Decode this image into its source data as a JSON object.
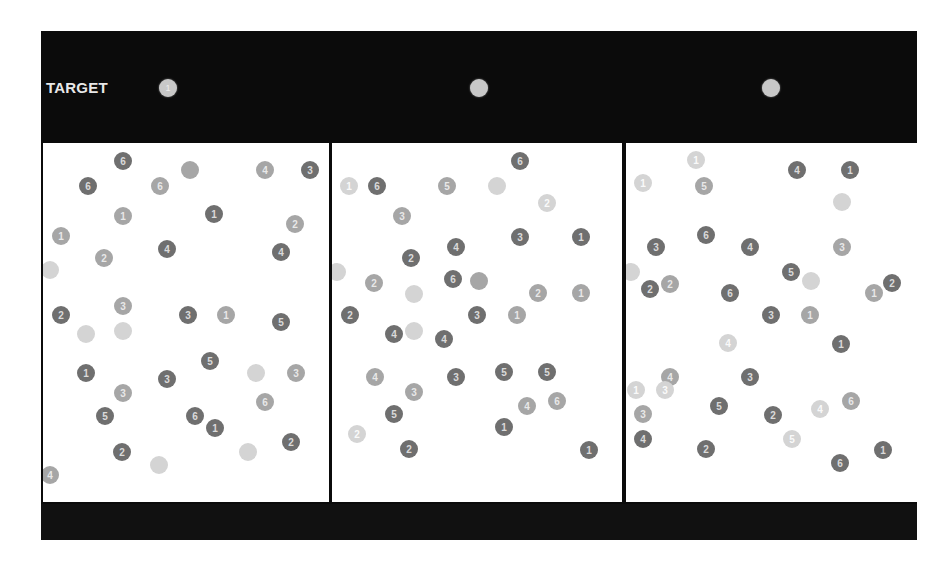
{
  "header": {
    "target_label": "TARGET",
    "targets": [
      {
        "digit": "1",
        "x": 118,
        "y": 48
      },
      {
        "digit": "",
        "x": 429,
        "y": 48
      },
      {
        "digit": "",
        "x": 721,
        "y": 48
      }
    ]
  },
  "panels": [
    {
      "left": 2,
      "width": 286,
      "dots": [
        {
          "d": "6",
          "x": 80,
          "y": 18,
          "t": "dark"
        },
        {
          "d": "6",
          "x": 45,
          "y": 43,
          "t": "dark"
        },
        {
          "d": "6",
          "x": 117,
          "y": 43,
          "t": "mid"
        },
        {
          "d": "",
          "x": 147,
          "y": 27,
          "t": "mid"
        },
        {
          "d": "4",
          "x": 222,
          "y": 27,
          "t": "mid"
        },
        {
          "d": "3",
          "x": 267,
          "y": 27,
          "t": "dark"
        },
        {
          "d": "1",
          "x": 80,
          "y": 73,
          "t": "mid"
        },
        {
          "d": "1",
          "x": 171,
          "y": 71,
          "t": "dark"
        },
        {
          "d": "2",
          "x": 252,
          "y": 81,
          "t": "mid"
        },
        {
          "d": "1",
          "x": 18,
          "y": 93,
          "t": "mid"
        },
        {
          "d": "4",
          "x": 124,
          "y": 106,
          "t": "dark"
        },
        {
          "d": "2",
          "x": 61,
          "y": 115,
          "t": "mid"
        },
        {
          "d": "4",
          "x": 238,
          "y": 109,
          "t": "dark"
        },
        {
          "d": "",
          "x": 7,
          "y": 127,
          "t": "light"
        },
        {
          "d": "3",
          "x": 80,
          "y": 163,
          "t": "mid"
        },
        {
          "d": "2",
          "x": 18,
          "y": 172,
          "t": "dark"
        },
        {
          "d": "3",
          "x": 145,
          "y": 172,
          "t": "dark"
        },
        {
          "d": "1",
          "x": 183,
          "y": 172,
          "t": "mid"
        },
        {
          "d": "5",
          "x": 238,
          "y": 179,
          "t": "dark"
        },
        {
          "d": "",
          "x": 43,
          "y": 191,
          "t": "light"
        },
        {
          "d": "",
          "x": 80,
          "y": 188,
          "t": "light"
        },
        {
          "d": "1",
          "x": 43,
          "y": 230,
          "t": "dark"
        },
        {
          "d": "3",
          "x": 124,
          "y": 236,
          "t": "dark"
        },
        {
          "d": "5",
          "x": 167,
          "y": 218,
          "t": "dark"
        },
        {
          "d": "",
          "x": 213,
          "y": 230,
          "t": "light"
        },
        {
          "d": "3",
          "x": 253,
          "y": 230,
          "t": "mid"
        },
        {
          "d": "3",
          "x": 80,
          "y": 250,
          "t": "mid"
        },
        {
          "d": "5",
          "x": 62,
          "y": 273,
          "t": "dark"
        },
        {
          "d": "6",
          "x": 152,
          "y": 273,
          "t": "dark"
        },
        {
          "d": "1",
          "x": 172,
          "y": 285,
          "t": "dark"
        },
        {
          "d": "6",
          "x": 222,
          "y": 259,
          "t": "mid"
        },
        {
          "d": "2",
          "x": 79,
          "y": 309,
          "t": "dark"
        },
        {
          "d": "",
          "x": 116,
          "y": 322,
          "t": "light"
        },
        {
          "d": "",
          "x": 205,
          "y": 309,
          "t": "light"
        },
        {
          "d": "2",
          "x": 248,
          "y": 299,
          "t": "dark"
        },
        {
          "d": "4",
          "x": 7,
          "y": 332,
          "t": "mid"
        }
      ]
    },
    {
      "left": 291,
      "width": 290,
      "dots": [
        {
          "d": "6",
          "x": 188,
          "y": 18,
          "t": "dark"
        },
        {
          "d": "1",
          "x": 17,
          "y": 43,
          "t": "light"
        },
        {
          "d": "6",
          "x": 45,
          "y": 43,
          "t": "dark"
        },
        {
          "d": "5",
          "x": 115,
          "y": 43,
          "t": "mid"
        },
        {
          "d": "",
          "x": 165,
          "y": 43,
          "t": "light"
        },
        {
          "d": "2",
          "x": 215,
          "y": 60,
          "t": "light"
        },
        {
          "d": "3",
          "x": 70,
          "y": 73,
          "t": "mid"
        },
        {
          "d": "3",
          "x": 188,
          "y": 94,
          "t": "dark"
        },
        {
          "d": "1",
          "x": 249,
          "y": 94,
          "t": "dark"
        },
        {
          "d": "4",
          "x": 124,
          "y": 104,
          "t": "dark"
        },
        {
          "d": "2",
          "x": 79,
          "y": 115,
          "t": "dark"
        },
        {
          "d": "6",
          "x": 121,
          "y": 136,
          "t": "dark"
        },
        {
          "d": "",
          "x": 147,
          "y": 138,
          "t": "mid"
        },
        {
          "d": "",
          "x": 5,
          "y": 129,
          "t": "light"
        },
        {
          "d": "2",
          "x": 42,
          "y": 140,
          "t": "mid"
        },
        {
          "d": "",
          "x": 82,
          "y": 151,
          "t": "light"
        },
        {
          "d": "2",
          "x": 206,
          "y": 150,
          "t": "mid"
        },
        {
          "d": "1",
          "x": 249,
          "y": 150,
          "t": "mid"
        },
        {
          "d": "2",
          "x": 18,
          "y": 172,
          "t": "dark"
        },
        {
          "d": "3",
          "x": 145,
          "y": 172,
          "t": "dark"
        },
        {
          "d": "1",
          "x": 185,
          "y": 172,
          "t": "mid"
        },
        {
          "d": "4",
          "x": 62,
          "y": 191,
          "t": "dark"
        },
        {
          "d": "",
          "x": 82,
          "y": 188,
          "t": "light"
        },
        {
          "d": "4",
          "x": 112,
          "y": 196,
          "t": "dark"
        },
        {
          "d": "4",
          "x": 43,
          "y": 234,
          "t": "mid"
        },
        {
          "d": "3",
          "x": 124,
          "y": 234,
          "t": "dark"
        },
        {
          "d": "5",
          "x": 172,
          "y": 229,
          "t": "dark"
        },
        {
          "d": "5",
          "x": 215,
          "y": 229,
          "t": "dark"
        },
        {
          "d": "3",
          "x": 82,
          "y": 249,
          "t": "mid"
        },
        {
          "d": "5",
          "x": 62,
          "y": 271,
          "t": "dark"
        },
        {
          "d": "4",
          "x": 195,
          "y": 263,
          "t": "mid"
        },
        {
          "d": "6",
          "x": 225,
          "y": 258,
          "t": "mid"
        },
        {
          "d": "2",
          "x": 25,
          "y": 291,
          "t": "light"
        },
        {
          "d": "2",
          "x": 77,
          "y": 306,
          "t": "dark"
        },
        {
          "d": "1",
          "x": 172,
          "y": 284,
          "t": "dark"
        },
        {
          "d": "1",
          "x": 257,
          "y": 307,
          "t": "dark"
        }
      ]
    },
    {
      "left": 585,
      "width": 291,
      "dots": [
        {
          "d": "1",
          "x": 70,
          "y": 17,
          "t": "light"
        },
        {
          "d": "1",
          "x": 17,
          "y": 40,
          "t": "light"
        },
        {
          "d": "5",
          "x": 78,
          "y": 43,
          "t": "mid"
        },
        {
          "d": "4",
          "x": 171,
          "y": 27,
          "t": "dark"
        },
        {
          "d": "1",
          "x": 224,
          "y": 27,
          "t": "dark"
        },
        {
          "d": "",
          "x": 216,
          "y": 59,
          "t": "light"
        },
        {
          "d": "3",
          "x": 30,
          "y": 104,
          "t": "dark"
        },
        {
          "d": "6",
          "x": 80,
          "y": 92,
          "t": "dark"
        },
        {
          "d": "4",
          "x": 124,
          "y": 104,
          "t": "dark"
        },
        {
          "d": "3",
          "x": 216,
          "y": 104,
          "t": "mid"
        },
        {
          "d": "",
          "x": 5,
          "y": 129,
          "t": "light"
        },
        {
          "d": "2",
          "x": 24,
          "y": 146,
          "t": "dark"
        },
        {
          "d": "2",
          "x": 44,
          "y": 141,
          "t": "mid"
        },
        {
          "d": "6",
          "x": 104,
          "y": 150,
          "t": "dark"
        },
        {
          "d": "5",
          "x": 165,
          "y": 129,
          "t": "dark"
        },
        {
          "d": "",
          "x": 185,
          "y": 138,
          "t": "light"
        },
        {
          "d": "1",
          "x": 248,
          "y": 150,
          "t": "mid"
        },
        {
          "d": "2",
          "x": 266,
          "y": 140,
          "t": "dark"
        },
        {
          "d": "3",
          "x": 145,
          "y": 172,
          "t": "dark"
        },
        {
          "d": "1",
          "x": 184,
          "y": 172,
          "t": "mid"
        },
        {
          "d": "1",
          "x": 215,
          "y": 201,
          "t": "dark"
        },
        {
          "d": "4",
          "x": 102,
          "y": 200,
          "t": "light"
        },
        {
          "d": "4",
          "x": 44,
          "y": 234,
          "t": "mid"
        },
        {
          "d": "1",
          "x": 10,
          "y": 247,
          "t": "light"
        },
        {
          "d": "3",
          "x": 39,
          "y": 247,
          "t": "light"
        },
        {
          "d": "3",
          "x": 124,
          "y": 234,
          "t": "dark"
        },
        {
          "d": "3",
          "x": 17,
          "y": 271,
          "t": "mid"
        },
        {
          "d": "5",
          "x": 93,
          "y": 263,
          "t": "dark"
        },
        {
          "d": "2",
          "x": 147,
          "y": 272,
          "t": "dark"
        },
        {
          "d": "4",
          "x": 194,
          "y": 266,
          "t": "light"
        },
        {
          "d": "6",
          "x": 225,
          "y": 258,
          "t": "mid"
        },
        {
          "d": "4",
          "x": 17,
          "y": 296,
          "t": "dark"
        },
        {
          "d": "2",
          "x": 80,
          "y": 306,
          "t": "dark"
        },
        {
          "d": "5",
          "x": 166,
          "y": 296,
          "t": "light"
        },
        {
          "d": "6",
          "x": 214,
          "y": 320,
          "t": "dark"
        },
        {
          "d": "1",
          "x": 257,
          "y": 307,
          "t": "dark"
        }
      ]
    }
  ],
  "colors": {
    "frame": "#0b0b0b",
    "panel": "#ffffff",
    "dark_dot": "#6f6f6f",
    "mid_dot": "#a6a6a6",
    "light_dot": "#d4d4d4"
  }
}
